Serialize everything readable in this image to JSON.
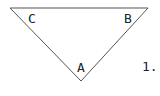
{
  "figure": {
    "number_label": "1.",
    "vertices": [
      {
        "label": "C",
        "x": 10,
        "y": 8
      },
      {
        "label": "B",
        "x": 148,
        "y": 8
      },
      {
        "label": "A",
        "x": 81,
        "y": 81
      }
    ],
    "stroke_color": "#555555"
  }
}
